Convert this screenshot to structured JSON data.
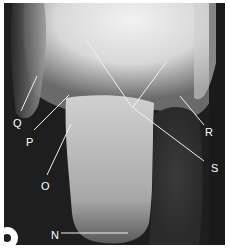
{
  "figure": {
    "kind": "radiograph",
    "labels": [
      {
        "id": "N",
        "text": "N",
        "x": 47,
        "y": 227
      },
      {
        "id": "O",
        "text": "O",
        "x": 37,
        "y": 178
      },
      {
        "id": "P",
        "text": "P",
        "x": 22,
        "y": 134
      },
      {
        "id": "Q",
        "text": "Q",
        "x": 9,
        "y": 115
      },
      {
        "id": "R",
        "text": "R",
        "x": 201,
        "y": 124
      },
      {
        "id": "S",
        "text": "S",
        "x": 207,
        "y": 160
      }
    ],
    "colors": {
      "background": "#1c1c1c",
      "bone_light": "#e8e8e8",
      "label": "#ffffff",
      "border": "#ffffff"
    }
  }
}
